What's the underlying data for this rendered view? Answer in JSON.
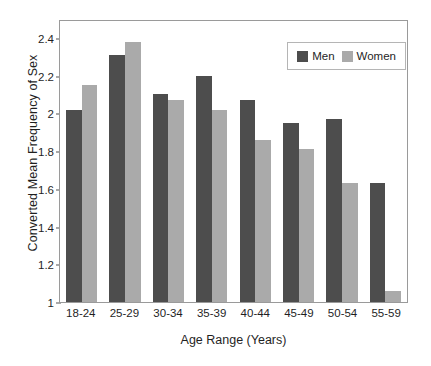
{
  "chart_data": {
    "type": "bar",
    "title": "",
    "xlabel": "Age Range (Years)",
    "ylabel": "Converted Mean Frequency of Sex",
    "categories": [
      "18-24",
      "25-29",
      "30-34",
      "35-39",
      "40-44",
      "45-49",
      "50-54",
      "55-59"
    ],
    "series": [
      {
        "name": "Men",
        "color": "#4d4d4d",
        "values": [
          2.02,
          2.31,
          2.1,
          2.2,
          2.07,
          1.95,
          1.97,
          1.63
        ]
      },
      {
        "name": "Women",
        "color": "#aaaaaa",
        "values": [
          2.15,
          2.38,
          2.07,
          2.02,
          1.86,
          1.81,
          1.63,
          1.06
        ]
      }
    ],
    "ylim": [
      1,
      2.5
    ],
    "ytick_labels": [
      "1",
      "1.2",
      "1.4",
      "1.6",
      "1.8",
      "2",
      "2.2",
      "2.4"
    ],
    "ytick_values": [
      1,
      1.2,
      1.4,
      1.6,
      1.8,
      2,
      2.2,
      2.4
    ],
    "grid": false,
    "legend_position": "top-right",
    "legend_entries": [
      "Men",
      "Women"
    ]
  }
}
